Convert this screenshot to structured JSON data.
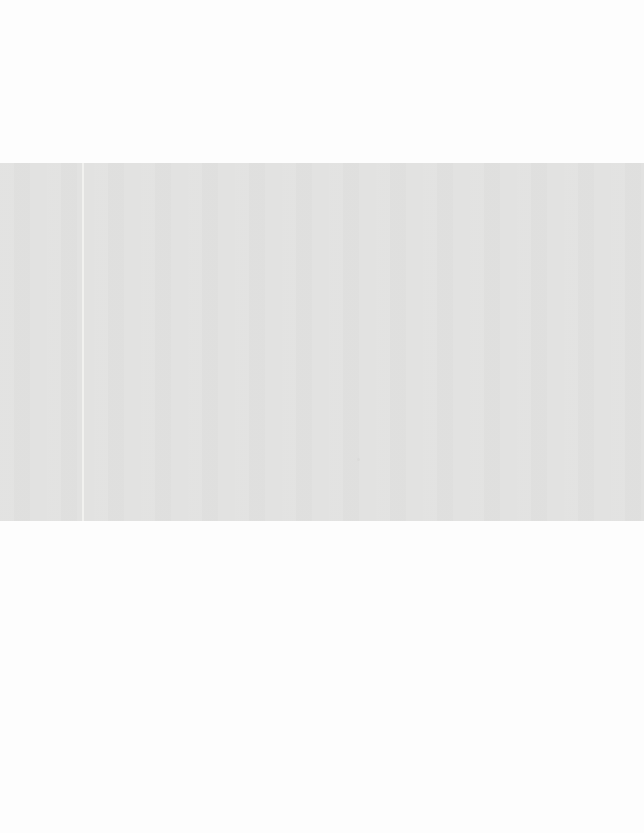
{
  "colors": {
    "page-bg": "#fdfdfd",
    "band-bg": "#e2e2e1",
    "crease-line": "#f3f3f1",
    "speck": "#d9d9d7"
  }
}
